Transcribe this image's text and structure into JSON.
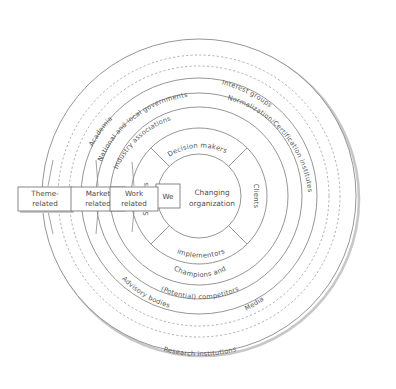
{
  "diagram": {
    "center": {
      "label": "Changing organization",
      "we_box": "We"
    },
    "inner_ring_quadrants": [
      {
        "name": "decision-makers",
        "label": "Decision makers",
        "position": "top"
      },
      {
        "name": "clients",
        "label": "Clients",
        "position": "right"
      },
      {
        "name": "champions-and-implementors",
        "label": "Champions and implementors",
        "position": "bottom",
        "line1": "Champions and",
        "line2": "implementors"
      },
      {
        "name": "suppliers",
        "label": "Suppliers",
        "position": "left"
      }
    ],
    "ring_labels": [
      {
        "name": "industry-associations",
        "label": "Industry associations",
        "ring": 2,
        "style": "solid"
      },
      {
        "name": "potential-competitors",
        "label": "(Potential) competitors",
        "ring": 2,
        "style": "solid"
      },
      {
        "name": "national-and-local-governments",
        "label": "National and local governments",
        "ring": 3,
        "style": "solid"
      },
      {
        "name": "normalization-certification-institutes",
        "label": "Normalization/Certification institutes",
        "ring": 3,
        "style": "solid"
      },
      {
        "name": "advisory-bodies",
        "label": "Advisory bodies",
        "ring": 3,
        "style": "solid"
      },
      {
        "name": "academia",
        "label": "Academia",
        "ring": 4,
        "style": "dashed"
      },
      {
        "name": "interest-groups",
        "label": "Interest groups",
        "ring": 4,
        "style": "dashed"
      },
      {
        "name": "media",
        "label": "Media",
        "ring": 4,
        "style": "dashed"
      },
      {
        "name": "research-institutions",
        "label": "Research institutions",
        "ring": 5,
        "style": "solid"
      }
    ],
    "left_boxes": [
      {
        "name": "theme-related",
        "line1": "Theme-",
        "line2": "related"
      },
      {
        "name": "market-related",
        "line1": "Market",
        "line2": "related"
      },
      {
        "name": "work-related",
        "line1": "Work",
        "line2": "related"
      }
    ],
    "colors": {
      "stroke": "#7a7a7a",
      "text": "#4a4a4a",
      "shadow": "#b8b8b8",
      "background": "#ffffff"
    }
  }
}
